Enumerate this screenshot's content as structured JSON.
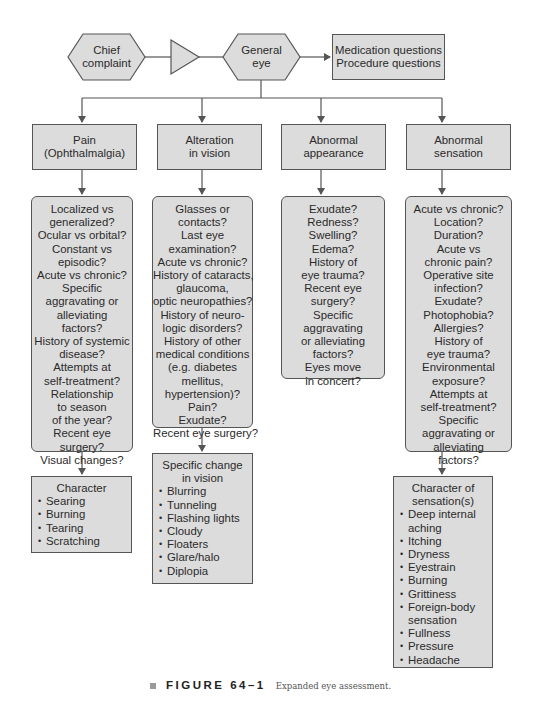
{
  "top_row": {
    "chief_complaint": [
      "Chief",
      "complaint"
    ],
    "general_eye": [
      "General",
      "eye"
    ],
    "questions_box": [
      "Medication questions",
      "Procedure questions"
    ]
  },
  "categories": [
    {
      "title": [
        "Pain",
        "(Ophthalmalgia)"
      ],
      "questions": [
        "Localized vs",
        "generalized?",
        "Ocular vs orbital?",
        "Constant vs",
        "episodic?",
        "Acute vs chronic?",
        "Specific",
        "aggravating or",
        "alleviating",
        "factors?",
        "History of systemic",
        "disease?",
        "Attempts at",
        "self-treatment?",
        "Relationship",
        "to season",
        "of the year?",
        "Recent eye",
        "surgery?",
        "Visual changes?"
      ],
      "detail": {
        "title": [
          "Character"
        ],
        "items": [
          "Searing",
          "Burning",
          "Tearing",
          "Scratching"
        ]
      }
    },
    {
      "title": [
        "Alteration",
        "in vision"
      ],
      "questions": [
        "Glasses or",
        "contacts?",
        "Last eye",
        "examination?",
        "Acute vs chronic?",
        "History of cataracts,",
        "glaucoma,",
        "optic neuropathies?",
        "History of neuro-",
        "logic disorders?",
        "History of other",
        "medical conditions",
        "(e.g. diabetes",
        "mellitus,",
        "hypertension)?",
        "Pain?",
        "Exudate?",
        "Recent eye surgery?"
      ],
      "detail": {
        "title": [
          "Specific change",
          "in vision"
        ],
        "items": [
          "Blurring",
          "Tunneling",
          "Flashing lights",
          "Cloudy",
          "Floaters",
          "Glare/halo",
          "Diplopia"
        ]
      }
    },
    {
      "title": [
        "Abnormal",
        "appearance"
      ],
      "questions": [
        "Exudate?",
        "Redness?",
        "Swelling?",
        "Edema?",
        "History of",
        "eye trauma?",
        "Recent eye",
        "surgery?",
        "Specific",
        "aggravating",
        "or alleviating",
        "factors?",
        "Eyes move",
        "in concert?"
      ]
    },
    {
      "title": [
        "Abnormal",
        "sensation"
      ],
      "questions": [
        "Acute vs chronic?",
        "Location?",
        "Duration?",
        "Acute vs",
        "chronic pain?",
        "Operative site",
        "infection?",
        "Exudate?",
        "Photophobia?",
        "Allergies?",
        "History of",
        "eye trauma?",
        "Environmental",
        "exposure?",
        "Attempts at",
        "self-treatment?",
        "Specific",
        "aggravating or",
        "alleviating",
        "factors?"
      ],
      "detail": {
        "title": [
          "Character of",
          "sensation(s)"
        ],
        "items": [
          "Deep internal",
          "aching",
          "Itching",
          "Dryness",
          "Eyestrain",
          "Burning",
          "Grittiness",
          "Foreign-body",
          "sensation",
          "Fullness",
          "Pressure",
          "Headache"
        ]
      }
    }
  ],
  "caption": {
    "figure_label": "FIGURE 64–1",
    "description": "Expanded eye assessment."
  },
  "colors": {
    "box_fill": "#dcdcdc",
    "line": "#555555",
    "background": "#ffffff"
  }
}
